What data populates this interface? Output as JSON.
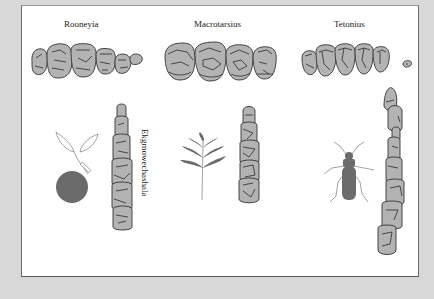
{
  "figure": {
    "background_color": "#d8d8d8",
    "panel_color": "#ffffff",
    "tooth_fill_color": "#b3b3b3",
    "icon_fill_color": "#6b6b6b"
  },
  "taxa": [
    {
      "name": "Rooneyia",
      "orientation": "horizontal",
      "tooth_count": 6
    },
    {
      "name": "Macrotarsius",
      "orientation": "horizontal",
      "tooth_count": 4
    },
    {
      "name": "Tetonius",
      "orientation": "horizontal",
      "tooth_count": 6
    },
    {
      "name": "Ekgmowechashala",
      "orientation": "vertical",
      "tooth_count": 6,
      "diet_icon": "fruit-icon"
    },
    {
      "name": "",
      "orientation": "vertical",
      "tooth_count": 5,
      "diet_icon": "leaf-icon"
    },
    {
      "name": "",
      "orientation": "vertical",
      "tooth_count": 8,
      "diet_icon": "insect-icon"
    }
  ],
  "labels": {
    "rooneyia": "Rooneyia",
    "macrotarsius": "Macrotarsius",
    "tetonius": "Tetonius",
    "ekgmowechashala": "Ekgmowechashala"
  },
  "diet_icons": [
    "fruit-icon",
    "leaf-icon",
    "insect-icon"
  ]
}
